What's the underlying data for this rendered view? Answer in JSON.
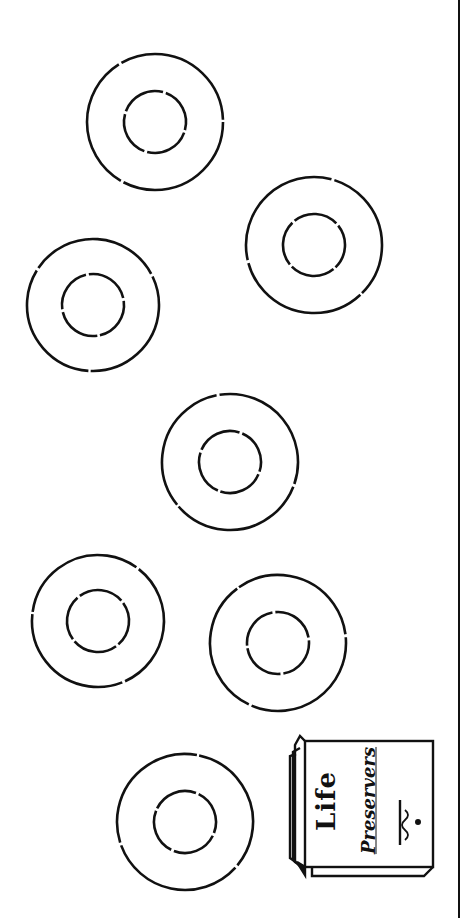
{
  "rings": [
    {
      "cx": 155,
      "cy": 122,
      "outer_r": 68,
      "inner_r": 31
    },
    {
      "cx": 314,
      "cy": 245,
      "outer_r": 68,
      "inner_r": 31
    },
    {
      "cx": 93,
      "cy": 305,
      "outer_r": 66,
      "inner_r": 31
    },
    {
      "cx": 230,
      "cy": 462,
      "outer_r": 68,
      "inner_r": 31
    },
    {
      "cx": 98,
      "cy": 621,
      "outer_r": 66,
      "inner_r": 31
    },
    {
      "cx": 278,
      "cy": 643,
      "outer_r": 68,
      "inner_r": 31
    },
    {
      "cx": 185,
      "cy": 822,
      "outer_r": 68,
      "inner_r": 31
    }
  ],
  "package": {
    "title_line1": "Life",
    "title_line2": "Preservers"
  },
  "colors": {
    "ink": "#111111",
    "paper": "#ffffff"
  }
}
